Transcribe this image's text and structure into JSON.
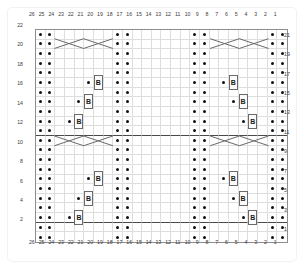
{
  "chart_data": {
    "type": "table",
    "grid": {
      "columns": 26,
      "rows": 22
    },
    "column_labels_top": [
      26,
      25,
      24,
      23,
      22,
      21,
      20,
      19,
      18,
      17,
      16,
      15,
      14,
      13,
      12,
      11,
      10,
      9,
      8,
      7,
      6,
      5,
      4,
      3,
      2,
      1
    ],
    "column_labels_bottom": [
      26,
      25,
      24,
      23,
      22,
      21,
      20,
      19,
      18,
      17,
      16,
      15,
      14,
      13,
      12,
      11,
      10,
      9,
      8,
      7,
      6,
      5,
      4,
      3,
      2,
      1
    ],
    "row_labels_left": [
      22,
      20,
      18,
      16,
      14,
      12,
      10,
      8,
      6,
      4,
      2
    ],
    "row_labels_right": [
      21,
      19,
      17,
      15,
      13,
      11,
      9,
      7,
      5,
      3,
      1
    ],
    "legend": {
      "dot": "purl stitch",
      "B": "bobble"
    },
    "purl_columns": [
      26,
      25,
      18,
      17,
      10,
      9,
      2,
      1
    ],
    "accent_color": "#111111",
    "grid_line_color": "#dedede",
    "border_color": "#8d8d8d",
    "separator_color": "#4a4a4a",
    "separator_after_rows": [
      12,
      3
    ],
    "bobbles": [
      {
        "row": 17,
        "dot_col": 21,
        "b_col": 20
      },
      {
        "row": 15,
        "dot_col": 22,
        "b_col": 21
      },
      {
        "row": 13,
        "dot_col": 23,
        "b_col": 22
      },
      {
        "row": 7,
        "dot_col": 21,
        "b_col": 20
      },
      {
        "row": 5,
        "dot_col": 22,
        "b_col": 21
      },
      {
        "row": 3,
        "dot_col": 23,
        "b_col": 22
      },
      {
        "row": 17,
        "dot_col": 7,
        "b_col": 6
      },
      {
        "row": 15,
        "dot_col": 6,
        "b_col": 5
      },
      {
        "row": 13,
        "dot_col": 5,
        "b_col": 4
      },
      {
        "row": 7,
        "dot_col": 7,
        "b_col": 6
      },
      {
        "row": 5,
        "dot_col": 6,
        "b_col": 5
      },
      {
        "row": 3,
        "dot_col": 5,
        "b_col": 4
      }
    ],
    "bobble_symbol": "B",
    "cables": [
      {
        "row": 21,
        "col_start": 24,
        "col_end": 19,
        "type": "cross"
      },
      {
        "row": 21,
        "col_start": 8,
        "col_end": 3,
        "type": "cross"
      },
      {
        "row": 11,
        "col_start": 24,
        "col_end": 19,
        "type": "cross"
      },
      {
        "row": 11,
        "col_start": 8,
        "col_end": 3,
        "type": "cross"
      }
    ]
  }
}
